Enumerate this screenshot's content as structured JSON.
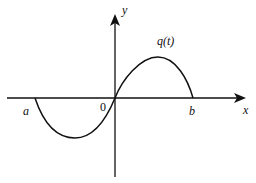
{
  "diagram": {
    "type": "function-graph",
    "axes": {
      "x_label": "x",
      "y_label": "y",
      "origin_label": "0"
    },
    "curve": {
      "label": "q(t)",
      "color": "#111111",
      "points_description": "negative lobe from a to 0, positive lobe from 0 to b"
    },
    "markers": {
      "left_root": "a",
      "right_root": "b"
    }
  }
}
